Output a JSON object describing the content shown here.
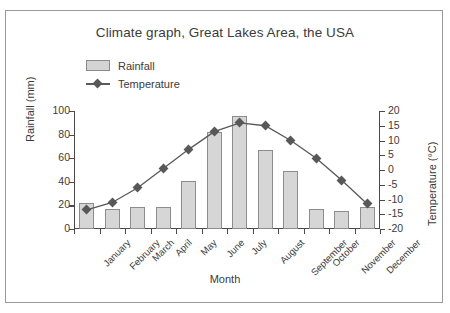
{
  "chart_data": {
    "type": "bar",
    "title": "Climate graph, Great Lakes Area, the USA",
    "xlabel": "Month",
    "ylabel": "Rainfall (mm)",
    "y2label": "Temperature (°C)",
    "categories": [
      "January",
      "February",
      "March",
      "April",
      "May",
      "June",
      "July",
      "August",
      "September",
      "October",
      "November",
      "December"
    ],
    "ylim": [
      0,
      100
    ],
    "yticks": [
      0,
      20,
      40,
      60,
      80,
      100
    ],
    "y2lim": [
      -20,
      20
    ],
    "y2ticks": [
      -20,
      -15,
      -10,
      -5,
      0,
      5,
      10,
      15,
      20
    ],
    "grid": false,
    "legend_position": "top-left",
    "series": [
      {
        "name": "Rainfall",
        "type": "bar",
        "axis": "left",
        "unit": "mm",
        "color": "#d6d6d6",
        "values": [
          22,
          17,
          19,
          19,
          41,
          82,
          96,
          67,
          49,
          17,
          15,
          19
        ]
      },
      {
        "name": "Temperature",
        "type": "line",
        "axis": "right",
        "unit": "°C",
        "color": "#585858",
        "values": [
          -13.5,
          -11,
          -6,
          0.5,
          7,
          13,
          16,
          15,
          10,
          4,
          -3.5,
          -11.5
        ]
      }
    ]
  },
  "legend": {
    "items": [
      {
        "label": "Rainfall",
        "marker": "swatch"
      },
      {
        "label": "Temperature",
        "marker": "line-diamond"
      }
    ]
  },
  "axis_labels": {
    "left_ticks": [
      "0",
      "20",
      "40",
      "60",
      "80",
      "100"
    ],
    "right_ticks": [
      "-20",
      "-15",
      "-10",
      "-5",
      "0",
      "5",
      "10",
      "15",
      "20"
    ]
  },
  "colors": {
    "bar_fill": "#d6d6d6",
    "bar_border": "#8c8c8c",
    "line": "#585858",
    "axis": "#4a4a4a",
    "text": "#3b3b3b",
    "frame": "#9a9a9a"
  }
}
